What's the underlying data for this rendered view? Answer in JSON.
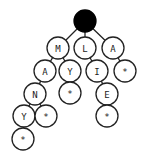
{
  "diagram": {
    "type": "trie",
    "root": {
      "id": "root",
      "x": 85,
      "y": 21,
      "r": 11,
      "filled": true
    },
    "nodes": [
      {
        "id": "n1",
        "label": "M",
        "x": 58,
        "y": 48,
        "parent": "root"
      },
      {
        "id": "n2",
        "label": "L",
        "x": 85,
        "y": 48,
        "parent": "root"
      },
      {
        "id": "n3",
        "label": "A",
        "x": 113,
        "y": 48,
        "parent": "root"
      },
      {
        "id": "n4",
        "label": "A",
        "x": 45,
        "y": 71,
        "parent": "n1"
      },
      {
        "id": "n5",
        "label": "Y",
        "x": 70,
        "y": 71,
        "parent": "n1"
      },
      {
        "id": "n6",
        "label": "I",
        "x": 97,
        "y": 71,
        "parent": "n2"
      },
      {
        "id": "n7",
        "label": "*",
        "x": 125,
        "y": 71,
        "parent": "n3"
      },
      {
        "id": "n8",
        "label": "N",
        "x": 35,
        "y": 94,
        "parent": "n4"
      },
      {
        "id": "n9",
        "label": "*",
        "x": 70,
        "y": 93,
        "parent": "n5"
      },
      {
        "id": "n10",
        "label": "E",
        "x": 107,
        "y": 94,
        "parent": "n6"
      },
      {
        "id": "n11",
        "label": "Y",
        "x": 24,
        "y": 116,
        "parent": "n8"
      },
      {
        "id": "n12",
        "label": "*",
        "x": 46,
        "y": 116,
        "parent": "n8"
      },
      {
        "id": "n13",
        "label": "*",
        "x": 107,
        "y": 116,
        "parent": "n10"
      },
      {
        "id": "n14",
        "label": "*",
        "x": 23,
        "y": 139,
        "parent": "n11"
      }
    ],
    "node_radius": 11,
    "colors": {
      "stroke": "#222222",
      "fill": "#ffffff",
      "root_fill": "#000000"
    }
  }
}
